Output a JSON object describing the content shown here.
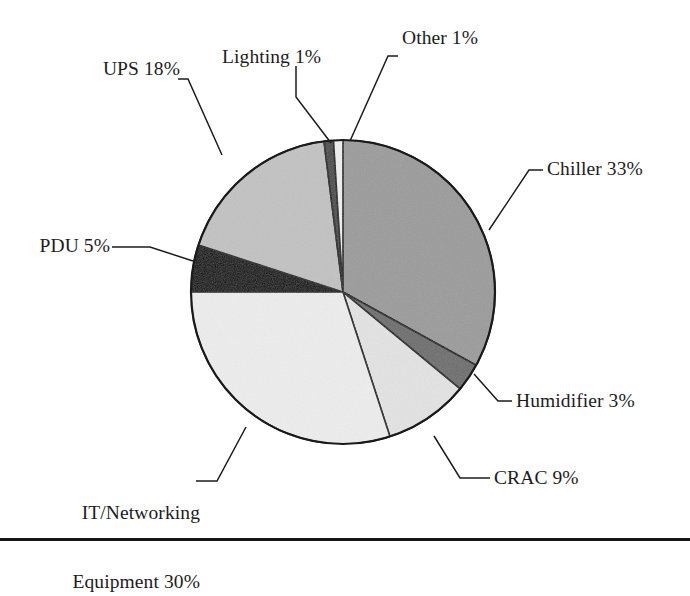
{
  "chart_data": {
    "type": "pie",
    "title": "",
    "subtitle": "",
    "xlabel": "",
    "ylabel": "",
    "legend_position": "none",
    "grid": false,
    "label_format": "name + percent",
    "start_angle_deg": 0,
    "direction": "clockwise",
    "units": "percent",
    "total": 100,
    "categories": [
      "Chiller",
      "Humidifier",
      "CRAC",
      "IT/Networking Equipment",
      "PDU",
      "UPS",
      "Lighting",
      "Other"
    ],
    "values": [
      33,
      3,
      9,
      30,
      5,
      18,
      1,
      1
    ],
    "slices": [
      {
        "name": "Chiller",
        "value": 33,
        "label": "Chiller 33%",
        "color": "#9b9b9b",
        "start_pct": 0,
        "end_pct": 33
      },
      {
        "name": "Humidifier",
        "value": 3,
        "label": "Humidifier 3%",
        "color": "#6d6d6d",
        "start_pct": 33,
        "end_pct": 36
      },
      {
        "name": "CRAC",
        "value": 9,
        "label": "CRAC 9%",
        "color": "#e3e3e3",
        "start_pct": 36,
        "end_pct": 45
      },
      {
        "name": "IT/Networking Equipment",
        "value": 30,
        "label": "IT/Networking\nEquipment 30%",
        "color": "#ededed",
        "start_pct": 45,
        "end_pct": 75
      },
      {
        "name": "PDU",
        "value": 5,
        "label": "PDU 5%",
        "color": "#000000",
        "start_pct": 75,
        "end_pct": 80
      },
      {
        "name": "UPS",
        "value": 18,
        "label": "UPS 18%",
        "color": "#c2c2c2",
        "start_pct": 80,
        "end_pct": 98
      },
      {
        "name": "Lighting",
        "value": 1,
        "label": "Lighting 1%",
        "color": "#4a4a4a",
        "start_pct": 98,
        "end_pct": 99
      },
      {
        "name": "Other",
        "value": 1,
        "label": "Other 1%",
        "color": "#efefef",
        "start_pct": 99,
        "end_pct": 100
      }
    ]
  },
  "labels": {
    "other": "Other 1%",
    "lighting": "Lighting 1%",
    "ups": "UPS 18%",
    "chiller": "Chiller 33%",
    "pdu": "PDU 5%",
    "humidifier": "Humidifier 3%",
    "crac": "CRAC 9%",
    "it_line1": "IT/Networking",
    "it_line2": "Equipment 30%"
  },
  "style": {
    "background": "#ffffff",
    "outline_color": "#1a1a1a",
    "leader_color": "#1c1c1c",
    "text_color": "#1c1c1c",
    "footer_rule_color": "#151515"
  }
}
